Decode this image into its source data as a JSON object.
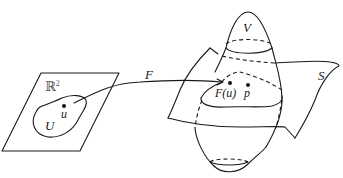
{
  "figure": {
    "domain_plane": {
      "label": "ℝ",
      "label_superscript": "2",
      "region_label": "U",
      "point_label": "u"
    },
    "map": {
      "label": "F"
    },
    "surface": {
      "label": "S",
      "neighborhood_label": "V",
      "image_point_label": "F(u)",
      "point_label": "p"
    }
  }
}
